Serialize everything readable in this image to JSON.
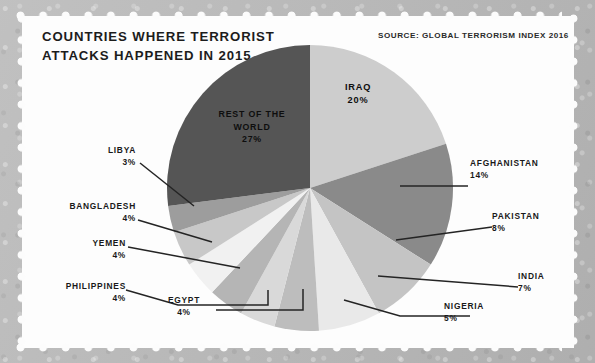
{
  "header": {
    "title": "COUNTRIES WHERE TERRORIST\nATTACKS HAPPENED IN 2015",
    "source": "SOURCE: GLOBAL TERRORISM INDEX 2016"
  },
  "colors": {
    "background": "#b8b8b8",
    "panel": "#fdfdfd",
    "text": "#191919",
    "rest_of_world": "#555555",
    "iraq": "#cdcdcd",
    "afghanistan": "#8a8a8a"
  },
  "inside_labels": {
    "rest_of_world": "REST OF THE\nWORLD\n27%",
    "iraq": "IRAQ\n20%"
  },
  "callouts": {
    "afghanistan": {
      "name": "AFGHANISTAN",
      "pct": "14%"
    },
    "pakistan": {
      "name": "PAKISTAN",
      "pct": "8%"
    },
    "india": {
      "name": "INDIA",
      "pct": "7%"
    },
    "nigeria": {
      "name": "NIGERIA",
      "pct": "5%"
    },
    "egypt": {
      "name": "EGYPT",
      "pct": "4%"
    },
    "philippines": {
      "name": "PHILIPPINES",
      "pct": "4%"
    },
    "yemen": {
      "name": "YEMEN",
      "pct": "4%"
    },
    "bangladesh": {
      "name": "BANGLADESH",
      "pct": "4%"
    },
    "libya": {
      "name": "LIBYA",
      "pct": "3%"
    }
  },
  "chart_data": {
    "type": "pie",
    "title": "COUNTRIES WHERE TERRORIST ATTACKS HAPPENED IN 2015",
    "source": "SOURCE: GLOBAL TERRORISM INDEX 2016",
    "unit": "percent of terrorist attacks",
    "start_angle_deg": 0,
    "direction": "clockwise",
    "legend": "none (direct labels with leader lines)",
    "categories": [
      "IRAQ",
      "AFGHANISTAN",
      "PAKISTAN",
      "INDIA",
      "NIGERIA",
      "EGYPT",
      "PHILIPPINES",
      "YEMEN",
      "BANGLADESH",
      "LIBYA",
      "REST OF THE WORLD"
    ],
    "values": [
      20,
      14,
      8,
      7,
      5,
      4,
      4,
      4,
      4,
      3,
      27
    ],
    "total": 100,
    "slices": [
      {
        "label": "IRAQ",
        "value": 20,
        "color": "#cdcdcd",
        "label_position": "inside"
      },
      {
        "label": "AFGHANISTAN",
        "value": 14,
        "color": "#8a8a8a",
        "label_position": "right"
      },
      {
        "label": "PAKISTAN",
        "value": 8,
        "color": "#c4c4c4",
        "label_position": "right"
      },
      {
        "label": "INDIA",
        "value": 7,
        "color": "#e9e9e9",
        "label_position": "right"
      },
      {
        "label": "NIGERIA",
        "value": 5,
        "color": "#bdbdbd",
        "label_position": "bottom"
      },
      {
        "label": "EGYPT",
        "value": 4,
        "color": "#d9d9d9",
        "label_position": "bottom"
      },
      {
        "label": "PHILIPPINES",
        "value": 4,
        "color": "#b5b5b5",
        "label_position": "left"
      },
      {
        "label": "YEMEN",
        "value": 4,
        "color": "#f1f1f1",
        "label_position": "left"
      },
      {
        "label": "BANGLADESH",
        "value": 4,
        "color": "#c8c8c8",
        "label_position": "left"
      },
      {
        "label": "LIBYA",
        "value": 3,
        "color": "#9d9d9d",
        "label_position": "left"
      },
      {
        "label": "REST OF THE WORLD",
        "value": 27,
        "color": "#555555",
        "label_position": "inside"
      }
    ]
  }
}
